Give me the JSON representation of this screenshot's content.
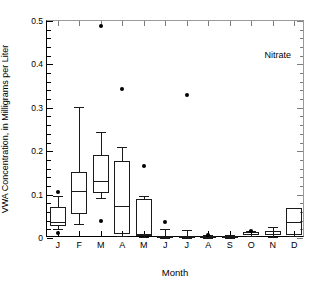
{
  "chart_data": {
    "type": "box",
    "title": "",
    "annotation": "Nitrate",
    "xlabel": "Month",
    "ylabel": "VWA Concentration, in Milligrams per Liter",
    "categories": [
      "J",
      "F",
      "M",
      "A",
      "M",
      "J",
      "J",
      "A",
      "S",
      "O",
      "N",
      "D"
    ],
    "category_names": [
      "January",
      "February",
      "March",
      "April",
      "May",
      "June",
      "July",
      "August",
      "September",
      "October",
      "November",
      "December"
    ],
    "ylim": [
      0,
      0.5
    ],
    "ytick_labels": [
      "0",
      "0.1",
      "0.2",
      "0.3",
      "0.4",
      "0.5"
    ],
    "ytick_values": [
      0,
      0.1,
      0.2,
      0.3,
      0.4,
      0.5
    ],
    "yminor_step": 0.02,
    "grid": false,
    "legend": "none",
    "boxes": [
      {
        "category": "J",
        "whisker_low": 0.02,
        "q1": 0.028,
        "median": 0.037,
        "q3": 0.071,
        "whisker_high": 0.097,
        "outliers": [
          0.107,
          0.011
        ]
      },
      {
        "category": "F",
        "whisker_low": 0.033,
        "q1": 0.055,
        "median": 0.109,
        "q3": 0.152,
        "whisker_high": 0.301,
        "outliers": []
      },
      {
        "category": "M",
        "whisker_low": 0.093,
        "q1": 0.104,
        "median": 0.131,
        "q3": 0.192,
        "whisker_high": 0.245,
        "outliers": [
          0.489,
          0.04
        ]
      },
      {
        "category": "A",
        "whisker_low": 0.004,
        "q1": 0.009,
        "median": 0.074,
        "q3": 0.177,
        "whisker_high": 0.209,
        "outliers": [
          0.343
        ]
      },
      {
        "category": "M",
        "whisker_low": 0.002,
        "q1": 0.006,
        "median": 0.008,
        "q3": 0.09,
        "whisker_high": 0.096,
        "outliers": [
          0.167
        ]
      },
      {
        "category": "J",
        "whisker_low": 0.001,
        "q1": 0.003,
        "median": 0.004,
        "q3": 0.005,
        "whisker_high": 0.02,
        "outliers": [
          0.037
        ]
      },
      {
        "category": "J",
        "whisker_low": 0.001,
        "q1": 0.002,
        "median": 0.003,
        "q3": 0.004,
        "whisker_high": 0.018,
        "outliers": [
          0.33
        ]
      },
      {
        "category": "A",
        "whisker_low": 0.001,
        "q1": 0.002,
        "median": 0.003,
        "q3": 0.004,
        "whisker_high": 0.006,
        "outliers": [
          0.008
        ]
      },
      {
        "category": "S",
        "whisker_low": 0.001,
        "q1": 0.002,
        "median": 0.003,
        "q3": 0.004,
        "whisker_high": 0.006,
        "outliers": []
      },
      {
        "category": "O",
        "whisker_low": 0.004,
        "q1": 0.007,
        "median": 0.009,
        "q3": 0.013,
        "whisker_high": 0.015,
        "outliers": [
          0.016
        ]
      },
      {
        "category": "N",
        "whisker_low": 0.002,
        "q1": 0.006,
        "median": 0.01,
        "q3": 0.015,
        "whisker_high": 0.026,
        "outliers": []
      },
      {
        "category": "D",
        "whisker_low": 0.005,
        "q1": 0.008,
        "median": 0.037,
        "q3": 0.068,
        "whisker_high": 0.07,
        "outliers": []
      }
    ]
  },
  "colors": {
    "axis": "#000000",
    "box_stroke": "#1a1a1a",
    "outlier": "#000000",
    "background": "#ffffff"
  }
}
